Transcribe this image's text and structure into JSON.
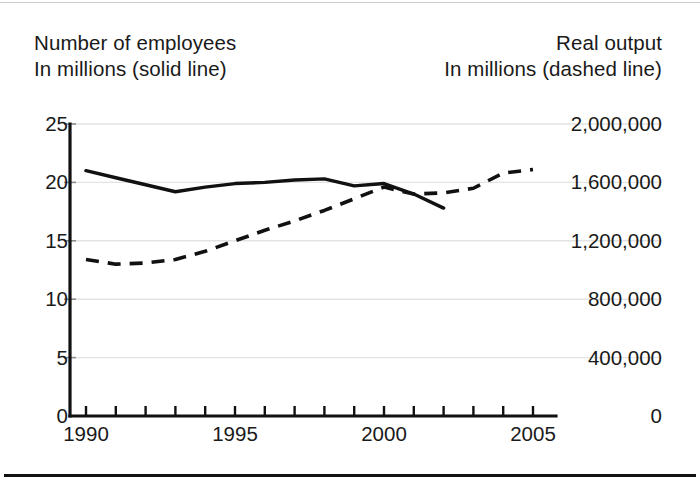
{
  "titles": {
    "left_line1": "Number of employees",
    "left_line2": "In millions (solid line)",
    "right_line1": "Real output",
    "right_line2": "In millions (dashed line)"
  },
  "colors": {
    "line": "#111111",
    "axis": "#111111",
    "grid": "#e3e3e3",
    "background": "#ffffff",
    "text": "#1a1a1a"
  },
  "axes": {
    "left_ticks": [
      "0",
      "5",
      "10",
      "15",
      "20",
      "25"
    ],
    "right_ticks": [
      "0",
      "400,000",
      "800,000",
      "1,200,000",
      "1,600,000",
      "2,000,000"
    ],
    "x_ticks": [
      "1990",
      "1995",
      "2000",
      "2005"
    ]
  },
  "chart_data": {
    "type": "line",
    "title": "",
    "xlabel": "",
    "ylabel": "Number of employees, in millions",
    "y2label": "Real output, in millions",
    "xlim": [
      1990,
      2005
    ],
    "ylim": [
      0,
      25
    ],
    "y2lim": [
      0,
      2000000
    ],
    "yticks": [
      0,
      5,
      10,
      15,
      20,
      25
    ],
    "yticklabels": [
      "0",
      "5",
      "10",
      "15",
      "20",
      "25"
    ],
    "y2ticks": [
      0,
      400000,
      800000,
      1200000,
      1600000,
      2000000
    ],
    "y2ticklabels": [
      "0",
      "400,000",
      "800,000",
      "1,200,000",
      "1,600,000",
      "2,000,000"
    ],
    "xticks": [
      1990,
      1995,
      2000,
      2005
    ],
    "xticklabels": [
      "1990",
      "1995",
      "2000",
      "2005"
    ],
    "x_minor_ticks_every": 1,
    "grid": "horizontal",
    "legend": "none",
    "series": [
      {
        "name": "Number of employees",
        "axis": "left",
        "style": "solid",
        "units": "millions",
        "x": [
          1990,
          1991,
          1992,
          1993,
          1994,
          1995,
          1996,
          1997,
          1998,
          1999,
          2000,
          2001,
          2002
        ],
        "values": [
          21.0,
          20.4,
          19.8,
          19.2,
          19.6,
          19.9,
          20.0,
          20.2,
          20.3,
          19.7,
          19.9,
          19.0,
          17.8
        ]
      },
      {
        "name": "Real output",
        "axis": "right",
        "style": "dashed",
        "units": "millions",
        "x": [
          1990,
          1991,
          1992,
          1993,
          1994,
          1995,
          1996,
          1997,
          1998,
          1999,
          2000,
          2001,
          2002,
          2003,
          2004,
          2005
        ],
        "values_left_scale": [
          13.4,
          13.0,
          13.1,
          13.4,
          14.1,
          15.0,
          15.9,
          16.7,
          17.6,
          18.6,
          19.6,
          19.0,
          19.1,
          19.5,
          20.8,
          21.1
        ],
        "values": [
          1072000,
          1040000,
          1048000,
          1072000,
          1128000,
          1200000,
          1272000,
          1336000,
          1408000,
          1488000,
          1568000,
          1520000,
          1528000,
          1560000,
          1664000,
          1688000
        ]
      }
    ]
  }
}
